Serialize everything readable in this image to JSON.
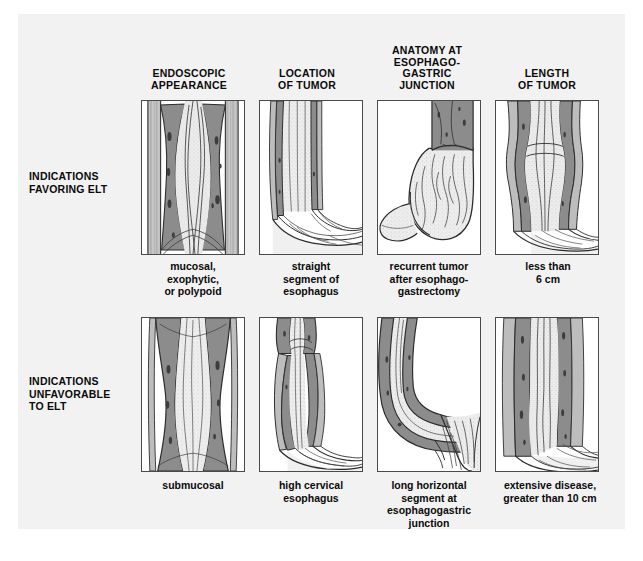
{
  "figure": {
    "background_color": "#f2f2f2",
    "panel_border_color": "#4a4a4a",
    "tumor_color": "#8c8c8c",
    "mucosa_color": "#e8e8e8",
    "ink_color": "#0a0a0a",
    "bottom_caption": ""
  },
  "columns": [
    {
      "id": "endoscopic-appearance",
      "label": "ENDOSCOPIC\nAPPEARANCE",
      "lines": [
        "ENDOSCOPIC",
        "APPEARANCE"
      ]
    },
    {
      "id": "location-of-tumor",
      "label": "LOCATION\nOF TUMOR",
      "lines": [
        "LOCATION",
        "OF TUMOR"
      ]
    },
    {
      "id": "anatomy-at-esophagogastric-junction",
      "label": "ANATOMY AT ESOPHAGO-GASTRIC JUNCTION",
      "lines": [
        "ANATOMY AT",
        "ESOPHAGO-",
        "GASTRIC",
        "JUNCTION"
      ]
    },
    {
      "id": "length-of-tumor",
      "label": "LENGTH\nOF TUMOR",
      "lines": [
        "LENGTH",
        "OF TUMOR"
      ]
    }
  ],
  "rows": [
    {
      "id": "favoring",
      "label_lines": [
        "INDICATIONS",
        "FAVORING ELT"
      ],
      "captions": [
        {
          "id": "mucosal-exophytic-polypoid",
          "lines": [
            "mucosal,",
            "exophytic,",
            "or polypoid"
          ]
        },
        {
          "id": "straight-segment-of-esophagus",
          "lines": [
            "straight",
            "segment of",
            "esophagus"
          ]
        },
        {
          "id": "recurrent-tumor-after-esophagogastrectomy",
          "lines": [
            "recurrent tumor",
            "after esophago-",
            "gastrectomy"
          ]
        },
        {
          "id": "less-than-6-cm",
          "lines": [
            "less than",
            "6 cm"
          ]
        }
      ]
    },
    {
      "id": "unfavorable",
      "label_lines": [
        "INDICATIONS",
        "UNFAVORABLE",
        "TO ELT"
      ],
      "captions": [
        {
          "id": "submucosal",
          "lines": [
            "submucosal"
          ]
        },
        {
          "id": "high-cervical-esophagus",
          "lines": [
            "high cervical",
            "esophagus"
          ]
        },
        {
          "id": "long-horizontal-segment-at-esophagogastric-junction",
          "lines": [
            "long horizontal",
            "segment at",
            "esophagogastric",
            "junction"
          ]
        },
        {
          "id": "extensive-disease-greater-than-10-cm",
          "lines": [
            "extensive disease,",
            "greater than 10 cm"
          ]
        }
      ]
    }
  ]
}
